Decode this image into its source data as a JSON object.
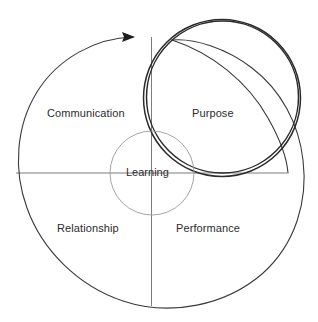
{
  "diagram": {
    "center_label": "Learning",
    "quadrants": [
      {
        "id": "communication",
        "label": "Communication",
        "position": "top-left"
      },
      {
        "id": "purpose",
        "label": "Purpose",
        "position": "top-right"
      },
      {
        "id": "relationship",
        "label": "Relationship",
        "position": "bottom-left"
      },
      {
        "id": "performance",
        "label": "Performance",
        "position": "bottom-right"
      }
    ],
    "shapes": {
      "outer_spiral": {
        "name": "outer-spiral-arc",
        "stroke": "#3a3a3a",
        "stroke_width": 1.1
      },
      "emphasis_circle": {
        "name": "emphasis-circle",
        "stroke": "#2b2b2b",
        "stroke_width": 2.6
      },
      "inner_circle": {
        "name": "inner-circle",
        "stroke": "#9a9a9a",
        "stroke_width": 0.9
      },
      "crosshair": {
        "name": "crosshair-axes",
        "stroke": "#6e6e6e",
        "stroke_width": 0.9
      },
      "arrow": {
        "name": "spiral-arrowhead",
        "fill": "#1f1f1f",
        "direction": "right"
      }
    },
    "colors": {
      "background": "#ffffff",
      "line_dark": "#3a3a3a",
      "line_mid": "#6e6e6e",
      "line_light": "#9a9a9a",
      "text": "#2c2c2c"
    }
  }
}
